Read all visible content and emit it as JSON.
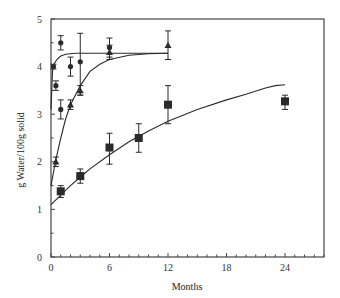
{
  "chart_data": {
    "type": "scatter",
    "title": "",
    "xlabel": "Months",
    "ylabel": "g Water/100g solid",
    "xlim": [
      0,
      28
    ],
    "ylim": [
      0,
      5
    ],
    "x_ticks": [
      0,
      6,
      12,
      18,
      24
    ],
    "y_ticks": [
      0,
      1,
      2,
      3,
      4,
      5
    ],
    "grid": false,
    "legend": null,
    "series": [
      {
        "name": "circles",
        "marker": "circle",
        "points": [
          {
            "x": 0.25,
            "y": 4.0,
            "err": [
              3.95,
              4.05
            ]
          },
          {
            "x": 0.5,
            "y": 3.6,
            "err": [
              3.5,
              3.7
            ]
          },
          {
            "x": 1,
            "y": 4.5,
            "err": [
              4.35,
              4.65
            ]
          },
          {
            "x": 1,
            "y": 3.1,
            "err": [
              2.9,
              3.3
            ]
          },
          {
            "x": 2,
            "y": 4.0,
            "err": [
              3.8,
              4.2
            ]
          },
          {
            "x": 3,
            "y": 4.1,
            "err": [
              3.4,
              4.7
            ]
          },
          {
            "x": 6,
            "y": 4.4,
            "err": [
              4.2,
              4.6
            ]
          }
        ],
        "fit_curve": [
          [
            0,
            3.1
          ],
          [
            0.15,
            3.9
          ],
          [
            0.3,
            4.05
          ],
          [
            0.6,
            4.15
          ],
          [
            1,
            4.22
          ],
          [
            1.5,
            4.26
          ],
          [
            2.5,
            4.28
          ],
          [
            6,
            4.28
          ],
          [
            12,
            4.28
          ]
        ]
      },
      {
        "name": "triangles",
        "marker": "triangle",
        "points": [
          {
            "x": 0.5,
            "y": 2.0,
            "err": [
              1.9,
              2.1
            ]
          },
          {
            "x": 2,
            "y": 3.2,
            "err": [
              3.1,
              3.3
            ]
          },
          {
            "x": 3,
            "y": 3.5,
            "err": [
              3.4,
              3.6
            ]
          },
          {
            "x": 6,
            "y": 4.3,
            "err": [
              4.15,
              4.45
            ]
          },
          {
            "x": 12,
            "y": 4.45,
            "err": [
              4.15,
              4.75
            ]
          }
        ],
        "fit_curve": [
          [
            0,
            1.5
          ],
          [
            0.5,
            2.05
          ],
          [
            1,
            2.5
          ],
          [
            1.5,
            2.9
          ],
          [
            2,
            3.2
          ],
          [
            3,
            3.6
          ],
          [
            4,
            3.9
          ],
          [
            5,
            4.05
          ],
          [
            6,
            4.15
          ],
          [
            8,
            4.24
          ],
          [
            10,
            4.27
          ],
          [
            12,
            4.28
          ]
        ]
      },
      {
        "name": "squares",
        "marker": "square",
        "points": [
          {
            "x": 1,
            "y": 1.38,
            "err": [
              1.25,
              1.5
            ]
          },
          {
            "x": 3,
            "y": 1.7,
            "err": [
              1.55,
              1.85
            ]
          },
          {
            "x": 6,
            "y": 2.3,
            "err": [
              1.95,
              2.6
            ]
          },
          {
            "x": 9,
            "y": 2.5,
            "err": [
              2.2,
              2.8
            ]
          },
          {
            "x": 12,
            "y": 3.2,
            "err": [
              2.8,
              3.6
            ]
          },
          {
            "x": 24,
            "y": 3.27,
            "err": [
              3.1,
              3.4
            ]
          }
        ],
        "fit_curve": [
          [
            0,
            1.1
          ],
          [
            1,
            1.3
          ],
          [
            2,
            1.5
          ],
          [
            3,
            1.68
          ],
          [
            4,
            1.85
          ],
          [
            6,
            2.15
          ],
          [
            8,
            2.42
          ],
          [
            10,
            2.65
          ],
          [
            12,
            2.85
          ],
          [
            15,
            3.1
          ],
          [
            18,
            3.3
          ],
          [
            20,
            3.42
          ],
          [
            22,
            3.55
          ],
          [
            23,
            3.6
          ],
          [
            24,
            3.62
          ]
        ]
      }
    ]
  },
  "colors": {
    "ink": "#2a2a2a",
    "axis": "#444444"
  }
}
